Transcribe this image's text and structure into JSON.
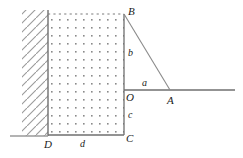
{
  "figure": {
    "colors": {
      "stroke": "#6f6f6f",
      "stroke_dark": "#555555",
      "dot": "#8a8a8a",
      "hatch": "#9a9a9a",
      "label": "#1a1a1a",
      "background": "#ffffff"
    },
    "geometry": {
      "wall_x": 48,
      "wall_top_y": 10,
      "wall_bottom_y": 136,
      "region_right_x": 124,
      "region_top_y": 14,
      "region_bottom_y": 135,
      "point_B": [
        124,
        14
      ],
      "point_O": [
        124,
        90
      ],
      "point_C": [
        124,
        135
      ],
      "point_D": [
        48,
        135
      ],
      "point_A": [
        170,
        90
      ],
      "horizontal_ray_end_x": 235,
      "ground_line_start_x": 10,
      "ground_line_end_x": 48,
      "dot_spacing": 8
    },
    "labels": [
      {
        "id": "point-b",
        "text": "B",
        "x": 128,
        "y": 6,
        "size": "upper"
      },
      {
        "id": "segment-b",
        "text": "b",
        "x": 128,
        "y": 48,
        "size": "lower"
      },
      {
        "id": "segment-a",
        "text": "a",
        "x": 142,
        "y": 78,
        "size": "lower"
      },
      {
        "id": "point-o",
        "text": "O",
        "x": 126,
        "y": 92,
        "size": "upper"
      },
      {
        "id": "point-a",
        "text": "A",
        "x": 167,
        "y": 95,
        "size": "upper"
      },
      {
        "id": "segment-c",
        "text": "c",
        "x": 128,
        "y": 110,
        "size": "lower"
      },
      {
        "id": "point-c",
        "text": "C",
        "x": 126,
        "y": 133,
        "size": "upper"
      },
      {
        "id": "segment-d",
        "text": "d",
        "x": 80,
        "y": 139,
        "size": "lower"
      },
      {
        "id": "point-d",
        "text": "D",
        "x": 44,
        "y": 139,
        "size": "upper"
      }
    ]
  }
}
